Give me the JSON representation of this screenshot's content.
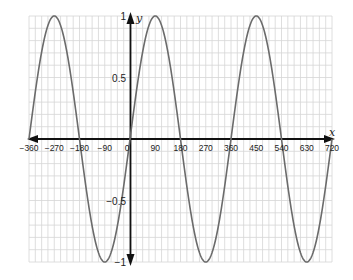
{
  "chart_data": {
    "type": "line",
    "title": "",
    "xlabel": "x",
    "ylabel": "y",
    "xlim": [
      -360,
      720
    ],
    "ylim": [
      -1,
      1
    ],
    "grid": true,
    "grid_minor_x": 22.5,
    "grid_minor_y": 0.1,
    "x_ticks": [
      "-360",
      "-270",
      "-180",
      "-90",
      "0",
      "90",
      "180",
      "270",
      "360",
      "450",
      "540",
      "630",
      "720"
    ],
    "y_ticks": [
      "1",
      "0.5",
      "-0.5",
      "-1"
    ],
    "function": "y = sin x",
    "series": [
      {
        "name": "y = sin x",
        "x": [
          -360,
          -270,
          -180,
          -90,
          0,
          90,
          180,
          270,
          360,
          450,
          540,
          630,
          720
        ],
        "values": [
          0,
          1,
          0,
          -1,
          0,
          1,
          0,
          -1,
          0,
          1,
          0,
          -1,
          0
        ]
      }
    ],
    "colors": {
      "curve": "#6b6b6b",
      "axis": "#111111",
      "grid": "#d6d6d6"
    }
  }
}
